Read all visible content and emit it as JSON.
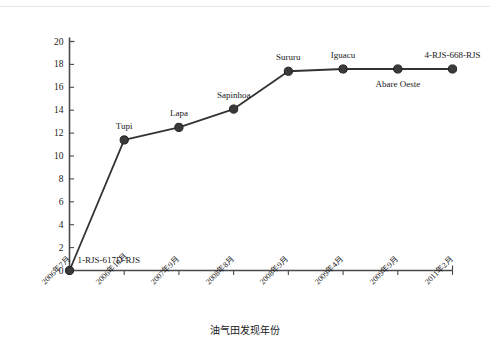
{
  "chart_data": {
    "type": "line",
    "title": "",
    "xlabel": "油气田发现年份",
    "ylabel": "累计可采储量（亿吨油当量）",
    "ylim": [
      0,
      20
    ],
    "yticks": [
      0,
      2,
      4,
      6,
      8,
      10,
      12,
      14,
      16,
      18,
      20
    ],
    "grid": false,
    "legend": "none",
    "categories": [
      "2006年7月",
      "2006年10月",
      "2007年9月",
      "2008年8月",
      "2008年9月",
      "2009年4月",
      "2009年9月",
      "2011年2月"
    ],
    "values": [
      0,
      11.4,
      12.5,
      14.1,
      17.4,
      17.6,
      17.6,
      17.6
    ],
    "point_labels": [
      "1-RJS-617D-RJS",
      "Tupi",
      "Lapa",
      "Sapinhoa",
      "Sururu",
      "Iguacu",
      "Abare Oeste",
      "4-RJS-668-RJS"
    ],
    "series_color": "#333333",
    "marker_color": "#3a3a3a"
  },
  "axes": {
    "y_tick_labels": [
      "20",
      "18",
      "16",
      "14",
      "12",
      "10",
      "8",
      "6",
      "4",
      "2",
      "0"
    ],
    "x_tick_labels": [
      "2006年7月",
      "2006年10月",
      "2007年9月",
      "2008年8月",
      "2008年9月",
      "2009年4月",
      "2009年9月",
      "2011年2月"
    ]
  },
  "labels": {
    "p0": "1-RJS-617D-RJS",
    "p1": "Tupi",
    "p2": "Lapa",
    "p3": "Sapinhoa",
    "p4": "Sururu",
    "p5": "Iguacu",
    "p6": "Abare Oeste",
    "p7": "4-RJS-668-RJS"
  }
}
